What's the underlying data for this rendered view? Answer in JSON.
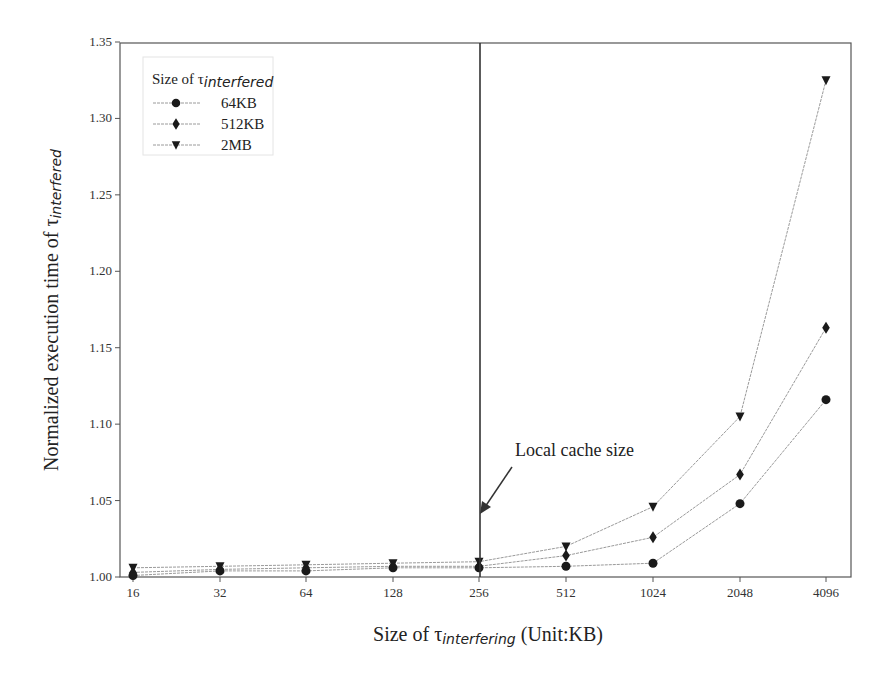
{
  "chart_data": {
    "type": "line",
    "title": "",
    "xlabel": "Size of τ_interfering (Unit:KB)",
    "xlabel_parts": {
      "prefix": "Size of τ",
      "sub": "interfering",
      "suffix": " (Unit:KB)"
    },
    "ylabel": "Normalized execution time of τ_interfered",
    "ylabel_parts": {
      "prefix": "Normalized execution time of τ",
      "sub": "interfered"
    },
    "categories": [
      "16",
      "32",
      "64",
      "128",
      "256",
      "512",
      "1024",
      "2048",
      "4096"
    ],
    "ylim": [
      1.0,
      1.35
    ],
    "yticks": [
      "1.00",
      "1.05",
      "1.10",
      "1.15",
      "1.20",
      "1.25",
      "1.30",
      "1.35"
    ],
    "grid": false,
    "legend": {
      "title_prefix": "Size of τ",
      "title_sub": "interfered",
      "position": "upper left"
    },
    "series": [
      {
        "name": "64KB",
        "marker": "circle",
        "values": [
          1.001,
          1.004,
          1.004,
          1.006,
          1.006,
          1.007,
          1.009,
          1.048,
          1.116
        ]
      },
      {
        "name": "512KB",
        "marker": "diamond",
        "values": [
          1.003,
          1.005,
          1.006,
          1.007,
          1.007,
          1.014,
          1.026,
          1.067,
          1.163
        ]
      },
      {
        "name": "2MB",
        "marker": "triangle-down",
        "values": [
          1.006,
          1.007,
          1.008,
          1.009,
          1.01,
          1.02,
          1.046,
          1.105,
          1.325
        ]
      }
    ],
    "annotations": [
      {
        "text": "Local cache size",
        "type": "vertical-line",
        "x": "256"
      }
    ],
    "colors": {
      "line": "#9a9a9a",
      "marker": "#1a1a1a",
      "axis": "#555555",
      "vline": "#333333"
    }
  }
}
